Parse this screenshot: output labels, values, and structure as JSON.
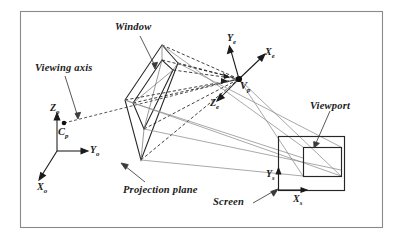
{
  "figure": {
    "kind": "diagram",
    "frame": {
      "border_color": "#8a8a8a",
      "background": "#ffffff"
    },
    "colors": {
      "ink": "#1a1a1a",
      "geometry_stroke": "#262626",
      "projection_ray": "#8c8c8c",
      "dashed_ray": "#1f1f1f",
      "leader_line": "#3a3a3a"
    }
  },
  "labels": {
    "window": "Window",
    "viewing_axis": "Viewing axis",
    "projection_plane": "Projection plane",
    "viewport": "Viewport",
    "screen": "Screen"
  },
  "points": {
    "center_of_projection": {
      "symbol": "C",
      "subscript": "p"
    },
    "view_point": {
      "symbol": "V",
      "subscript": "p"
    }
  },
  "axes": {
    "world": {
      "name": "object/world coordinate system",
      "items": [
        {
          "symbol": "Z",
          "subscript": "o",
          "direction": "up"
        },
        {
          "symbol": "Y",
          "subscript": "o",
          "direction": "right"
        },
        {
          "symbol": "X",
          "subscript": "o",
          "direction": "down-left"
        }
      ]
    },
    "eye": {
      "name": "eye/viewing coordinate system",
      "items": [
        {
          "symbol": "Y",
          "subscript": "e",
          "direction": "up-left"
        },
        {
          "symbol": "X",
          "subscript": "e",
          "direction": "up-right"
        },
        {
          "symbol": "Z",
          "subscript": "e",
          "direction": "down-left"
        }
      ]
    },
    "screen": {
      "name": "screen coordinate system",
      "items": [
        {
          "symbol": "Y",
          "subscript": "s",
          "direction": "up"
        },
        {
          "symbol": "X",
          "subscript": "s",
          "direction": "right"
        }
      ]
    }
  }
}
